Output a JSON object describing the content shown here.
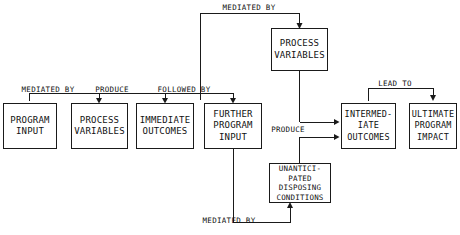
{
  "diagram": {
    "background_color": "#ffffff",
    "stroke_color": "#1a1a1a",
    "text_color": "#111111",
    "nodes": [
      {
        "id": "program-input",
        "lines": [
          "PROGRAM",
          "INPUT"
        ],
        "x": 3,
        "y": 103,
        "w": 54,
        "h": 46
      },
      {
        "id": "process-variables-row",
        "lines": [
          "PROCESS",
          "VARIABLES"
        ],
        "x": 71,
        "y": 103,
        "w": 57,
        "h": 46
      },
      {
        "id": "immediate-outcomes",
        "lines": [
          "IMMEDIATE",
          "OUTCOMES"
        ],
        "x": 136,
        "y": 103,
        "w": 58,
        "h": 46
      },
      {
        "id": "further-program-input",
        "lines": [
          "FURTHER",
          "PROGRAM",
          "INPUT"
        ],
        "x": 204,
        "y": 103,
        "w": 58,
        "h": 46
      },
      {
        "id": "process-variables-top",
        "lines": [
          "PROCESS",
          "VARIABLES"
        ],
        "x": 271,
        "y": 28,
        "w": 57,
        "h": 43
      },
      {
        "id": "intermediate-outcomes",
        "lines": [
          "INTERMED-",
          "IATE",
          "OUTCOMES"
        ],
        "x": 341,
        "y": 103,
        "w": 55,
        "h": 46
      },
      {
        "id": "ultimate-program-impact",
        "lines": [
          "ULTIMATE",
          "PROGRAM",
          "IMPACT"
        ],
        "x": 409,
        "y": 103,
        "w": 48,
        "h": 46
      },
      {
        "id": "unanticipated-disposing-conditions",
        "lines": [
          "UNANTICI-",
          "PATED",
          "DISPOSING",
          "CONDITIONS"
        ],
        "x": 269,
        "y": 163,
        "w": 62,
        "h": 40
      }
    ],
    "edge_labels": [
      {
        "id": "mediated-by-top",
        "text": "MEDIATED BY",
        "x": 218,
        "y": 3,
        "w": 62
      },
      {
        "id": "mediated-by-left",
        "text": "MEDIATED BY",
        "x": 17,
        "y": 85,
        "w": 62
      },
      {
        "id": "produce-left",
        "text": "PRODUCE",
        "x": 90,
        "y": 85,
        "w": 44
      },
      {
        "id": "followed-by",
        "text": "FOLLOWED BY",
        "x": 152,
        "y": 85,
        "w": 64
      },
      {
        "id": "lead-to",
        "text": "LEAD TO",
        "x": 374,
        "y": 79,
        "w": 42
      },
      {
        "id": "produce-right",
        "text": "PRODUCE",
        "x": 266,
        "y": 128,
        "w": 44
      },
      {
        "id": "mediated-by-bottom",
        "text": "MEDIATED BY",
        "x": 198,
        "y": 216,
        "w": 62
      }
    ]
  }
}
